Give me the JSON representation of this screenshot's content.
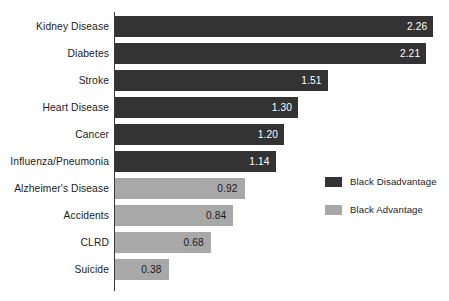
{
  "chart_data": {
    "type": "bar",
    "orientation": "horizontal",
    "title": "",
    "subtitle": "",
    "xlabel": "",
    "ylabel": "",
    "grid": false,
    "axis": {
      "baseline": 0,
      "xlim": [
        0,
        2.4
      ]
    },
    "categories": [
      "Kidney Disease",
      "Diabetes",
      "Stroke",
      "Heart Disease",
      "Cancer",
      "Influenza/Pneumonia",
      "Alzheimer's Disease",
      "Accidents",
      "CLRD",
      "Suicide"
    ],
    "values": [
      2.26,
      2.21,
      1.51,
      1.3,
      1.2,
      1.14,
      0.92,
      0.84,
      0.68,
      0.38
    ],
    "value_labels": [
      "2.26",
      "2.21",
      "1.51",
      "1.30",
      "1.20",
      "1.14",
      "0.92",
      "0.84",
      "0.68",
      "0.38"
    ],
    "series_of_bar": [
      "Black Disadvantage",
      "Black Disadvantage",
      "Black Disadvantage",
      "Black Disadvantage",
      "Black Disadvantage",
      "Black Disadvantage",
      "Black Advantage",
      "Black Advantage",
      "Black Advantage",
      "Black Advantage"
    ],
    "legend": {
      "position": "right",
      "entries": [
        {
          "label": "Black Disadvantage",
          "color": "#333333"
        },
        {
          "label": "Black Advantage",
          "color": "#a8a8a8"
        }
      ]
    }
  },
  "colors": {
    "disadvantage": "#333333",
    "advantage": "#a8a8a8",
    "axis": "#3a3a3a",
    "background": "#ffffff",
    "value_on_dark": "#ffffff",
    "value_on_light": "#1a1a1a"
  }
}
